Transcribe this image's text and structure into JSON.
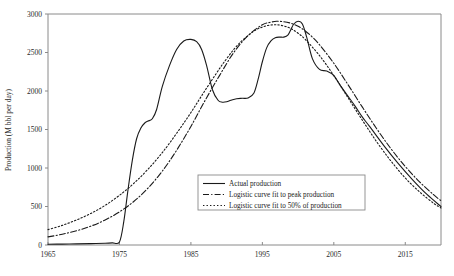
{
  "chart_data": {
    "type": "line",
    "title": "",
    "xlabel": "",
    "ylabel": "Production (M bbl per day)",
    "xlim": [
      1965,
      2020
    ],
    "ylim": [
      0,
      3000
    ],
    "grid": false,
    "legend_position": "center",
    "xticks": [
      "1965",
      "1975",
      "1985",
      "1995",
      "2005",
      "2015"
    ],
    "xtick_values": [
      1965,
      1975,
      1985,
      1995,
      2005,
      2015
    ],
    "yticks": [
      "0",
      "500",
      "1000",
      "1500",
      "2000",
      "2500",
      "3000"
    ],
    "ytick_values": [
      0,
      500,
      1000,
      1500,
      2000,
      2500,
      3000
    ],
    "series": [
      {
        "name": "Actual production",
        "style": "solid",
        "x": [
          1965,
          1967,
          1969,
          1971,
          1973,
          1974,
          1975,
          1975.6,
          1976.2,
          1976.8,
          1977.4,
          1978,
          1978.6,
          1979,
          1979.6,
          1980.2,
          1981,
          1982,
          1983,
          1984,
          1985,
          1985.8,
          1986.5,
          1987.2,
          1988,
          1988.8,
          1989.4,
          1990,
          1990.6,
          1991.4,
          1992.2,
          1993,
          1993.8,
          1994.4,
          1995,
          1995.6,
          1996.2,
          1996.8,
          1997.4,
          1998,
          1998.6,
          1999,
          1999.4,
          2000,
          2000.6,
          2001.2,
          2002,
          2003,
          2004,
          2005,
          2006,
          2007,
          2008,
          2009,
          2010,
          2012,
          2014,
          2016,
          2018,
          2020
        ],
        "y": [
          10,
          12,
          15,
          18,
          22,
          28,
          40,
          300,
          720,
          1100,
          1380,
          1520,
          1590,
          1610,
          1640,
          1760,
          2060,
          2330,
          2540,
          2650,
          2670,
          2640,
          2540,
          2330,
          2020,
          1880,
          1855,
          1860,
          1880,
          1900,
          1905,
          1910,
          1970,
          2150,
          2380,
          2560,
          2650,
          2690,
          2700,
          2700,
          2730,
          2800,
          2870,
          2905,
          2870,
          2700,
          2420,
          2280,
          2260,
          2200,
          2060,
          1930,
          1800,
          1660,
          1540,
          1290,
          1060,
          850,
          660,
          500
        ]
      },
      {
        "name": "Logistic curve fit to peak production",
        "style": "dashdot",
        "x": [
          1965,
          1967,
          1969,
          1971,
          1973,
          1975,
          1977,
          1979,
          1981,
          1983,
          1985,
          1987,
          1989,
          1991,
          1993,
          1995,
          1996,
          1997,
          1998,
          1999,
          2000,
          2001,
          2002,
          2003,
          2005,
          2007,
          2009,
          2011,
          2013,
          2015,
          2017,
          2019,
          2020
        ],
        "y": [
          105,
          140,
          185,
          245,
          325,
          430,
          565,
          740,
          960,
          1230,
          1540,
          1880,
          2200,
          2500,
          2720,
          2860,
          2890,
          2905,
          2900,
          2880,
          2840,
          2780,
          2700,
          2600,
          2360,
          2080,
          1790,
          1510,
          1250,
          1020,
          820,
          650,
          575
        ]
      },
      {
        "name": "Logistic curve fit to 50% of production",
        "style": "dotted",
        "x": [
          1965,
          1967,
          1969,
          1971,
          1973,
          1975,
          1977,
          1979,
          1981,
          1983,
          1985,
          1987,
          1989,
          1990,
          1991,
          1992,
          1993,
          1994,
          1995,
          1996,
          1997,
          1998,
          1999,
          2000,
          2001,
          2003,
          2005,
          2007,
          2009,
          2011,
          2013,
          2015,
          2017,
          2019,
          2020
        ],
        "y": [
          200,
          255,
          325,
          410,
          515,
          645,
          800,
          985,
          1200,
          1450,
          1720,
          2010,
          2290,
          2420,
          2540,
          2640,
          2720,
          2790,
          2830,
          2855,
          2860,
          2845,
          2810,
          2750,
          2670,
          2460,
          2200,
          1910,
          1620,
          1340,
          1090,
          870,
          690,
          540,
          480
        ]
      }
    ]
  },
  "legend": {
    "items": [
      {
        "label": "Actual production",
        "style": "solid"
      },
      {
        "label": "Logistic curve fit to peak production",
        "style": "dashdot"
      },
      {
        "label": "Logistic curve fit to 50% of production",
        "style": "dotted"
      }
    ]
  }
}
